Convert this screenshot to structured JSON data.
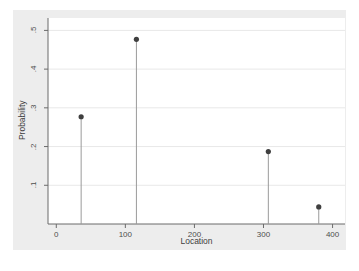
{
  "chart_data": {
    "type": "scatter",
    "title": "",
    "xlabel": "Location",
    "ylabel": "Probability",
    "x": [
      36,
      116,
      307,
      380
    ],
    "values": [
      0.277,
      0.477,
      0.187,
      0.044
    ],
    "points": [
      {
        "x": 36,
        "y": 0.277
      },
      {
        "x": 116,
        "y": 0.477
      },
      {
        "x": 307,
        "y": 0.187
      },
      {
        "x": 380,
        "y": 0.044
      }
    ],
    "xlim": [
      -12,
      418
    ],
    "ylim": [
      0.0,
      0.532
    ],
    "xticks": [
      0,
      100,
      200,
      300,
      400
    ],
    "xtick_labels": [
      "0",
      "100",
      "200",
      "300",
      "400"
    ],
    "yticks": [
      0.1,
      0.2,
      0.3,
      0.4,
      0.5
    ],
    "ytick_labels": [
      ".1",
      ".2",
      ".3",
      ".4",
      ".5"
    ],
    "grid": "horizontal",
    "legend": "none",
    "marker": "filled-circle",
    "style": "stem-with-markers",
    "colors": {
      "marker": "#3f3f3f",
      "stem": "#9a9a9a",
      "gridline": "#e8e8e8",
      "axis": "#6b6b6b",
      "plot_background": "#ffffff",
      "graph_background": "#ededed",
      "tick_label": "#4d4d4d",
      "axis_title": "#3d3d3d"
    }
  }
}
